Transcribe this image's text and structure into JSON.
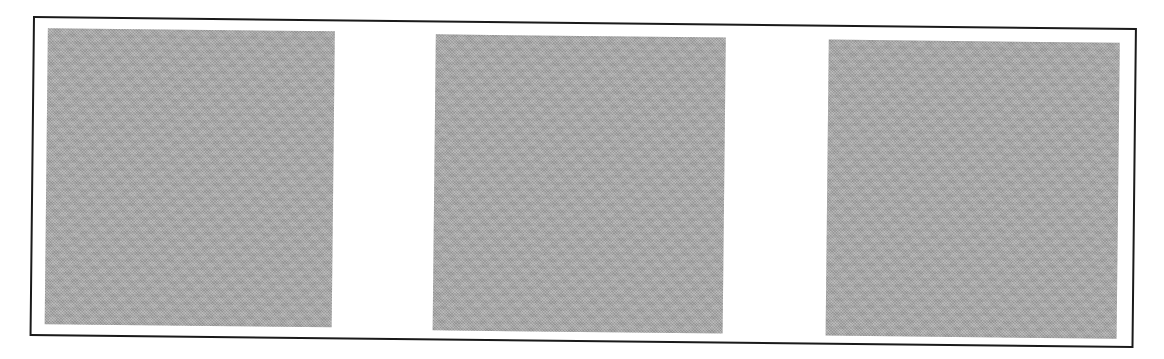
{
  "figure": {
    "frame": {
      "border_color": "#1a1a1a",
      "background": "#ffffff"
    },
    "panels": [
      {
        "index": 1,
        "fill_color": "#a9a9a9",
        "texture": "halftone",
        "text": ""
      },
      {
        "index": 2,
        "fill_color": "#a9a9a9",
        "texture": "halftone",
        "text": ""
      },
      {
        "index": 3,
        "fill_color": "#a9a9a9",
        "texture": "halftone",
        "text": ""
      }
    ]
  }
}
